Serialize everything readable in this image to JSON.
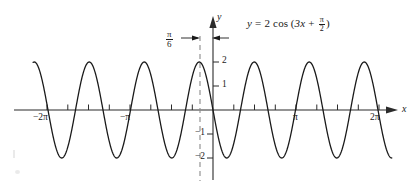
{
  "figure": {
    "title_equation": {
      "lhs": "y",
      "equals": "=",
      "amplitude": "2",
      "func": "cos",
      "open_paren": "(",
      "inner_linear": "3x",
      "plus": "+",
      "phase_num": "π",
      "phase_den": "2",
      "close_paren": ")",
      "plain": "y = 2 cos(3x + π/2)"
    },
    "axes": {
      "x_axis_label": "x",
      "y_axis_label": "y",
      "x_tick_labels": [
        {
          "text": "−2π",
          "value": -6.283185
        },
        {
          "text": "−π",
          "value": -3.141593
        },
        {
          "text": "π",
          "value": 3.141593
        },
        {
          "text": "2π",
          "value": 6.283185
        }
      ],
      "y_tick_labels": [
        {
          "text": "2",
          "value": 2
        },
        {
          "text": "1",
          "value": 1
        },
        {
          "text": "−1",
          "value": -1
        },
        {
          "text": "−2",
          "value": -2
        }
      ]
    },
    "annotation": {
      "phase_shift_num": "π",
      "phase_shift_den": "6",
      "phase_shift_plain": "π/6",
      "dashed_line_x": -0.5235988
    },
    "colors": {
      "curve": "#1a1a1a",
      "axis": "#2b2b2b",
      "dashed": "#8a8a8a",
      "background": "#ffffff"
    }
  },
  "chart_data": {
    "type": "line",
    "xlabel": "x",
    "ylabel": "y",
    "xlim": [
      -6.806784,
      6.806784
    ],
    "ylim": [
      -2.6,
      2.6
    ],
    "grid": false,
    "legend": false,
    "function": {
      "expression": "2*cos(3*x + pi/2)",
      "amplitude": 2,
      "angular_frequency": 3,
      "phase": 1.5707963,
      "period": 2.0943951,
      "phase_shift": -0.5235988
    },
    "x_ticks": [
      -6.283185,
      -5.497787,
      -4.712389,
      -3.926991,
      -3.141593,
      -2.356194,
      -1.570796,
      -0.785398,
      0.785398,
      1.570796,
      2.356194,
      3.141593,
      3.926991,
      4.712389,
      5.497787,
      6.283185
    ],
    "x_tick_labels": [
      "−2π",
      "",
      "",
      "",
      "−π",
      "",
      "",
      "",
      "",
      "",
      "",
      "π",
      "",
      "",
      "",
      "2π"
    ],
    "y_ticks": [
      -2,
      -1,
      1,
      2
    ],
    "y_tick_labels": [
      "−2",
      "−1",
      "1",
      "2"
    ],
    "annotations": [
      {
        "text": "π/6",
        "kind": "phase-shift-bracket",
        "x_from": -0.5235988,
        "x_to": 0
      },
      {
        "text": "y = 2 cos(3x + π/2)",
        "kind": "equation-label",
        "x": 2.0,
        "y": 2.4
      }
    ],
    "maxima_x": [
      -6.283185,
      -4.18879,
      -2.094395,
      -0.523599,
      1.570796,
      3.665191,
      5.759587
    ],
    "minima_x": [
      -5.235988,
      -3.141593,
      -1.047198,
      0.523599,
      2.617994,
      4.712389
    ],
    "series": [
      {
        "name": "y = 2 cos(3x + π/2)",
        "x": [
          -6.8,
          -6.6,
          -6.4,
          -6.2,
          -6.0,
          -5.8,
          -5.6,
          -5.4,
          -5.2,
          -5.0,
          -4.8,
          -4.6,
          -4.4,
          -4.2,
          -4.0,
          -3.8,
          -3.6,
          -3.4,
          -3.2,
          -3.0,
          -2.8,
          -2.6,
          -2.4,
          -2.2,
          -2.0,
          -1.8,
          -1.6,
          -1.4,
          -1.2,
          -1.0,
          -0.8,
          -0.6,
          -0.4,
          -0.2,
          0.0,
          0.2,
          0.4,
          0.6,
          0.8,
          1.0,
          1.2,
          1.4,
          1.6,
          1.8,
          2.0,
          2.2,
          2.4,
          2.6,
          2.8,
          3.0,
          3.2,
          3.4,
          3.6,
          3.8,
          4.0,
          4.2,
          4.4,
          4.6,
          4.8,
          5.0,
          5.2,
          5.4,
          5.6,
          5.8,
          6.0,
          6.2,
          6.4,
          6.6,
          6.8
        ],
        "y": [
          1.03,
          1.94,
          1.52,
          0.11,
          -1.35,
          -1.99,
          -1.17,
          0.34,
          1.65,
          1.85,
          0.71,
          -0.85,
          -1.89,
          -1.59,
          -0.23,
          1.28,
          2.0,
          1.28,
          -0.23,
          -1.59,
          -1.89,
          -0.85,
          0.71,
          1.85,
          1.65,
          0.34,
          -1.17,
          -1.99,
          -1.35,
          0.11,
          1.52,
          1.94,
          1.03,
          -0.56,
          -1.77,
          -1.75,
          -0.52,
          1.06,
          1.95,
          1.49,
          0.07,
          -1.38,
          -1.99,
          -1.14,
          0.38,
          1.67,
          1.83,
          0.67,
          -0.88,
          -1.9,
          -1.57,
          -0.19,
          1.31,
          2.0,
          1.25,
          -0.27,
          -1.61,
          -1.88,
          -0.82,
          0.75,
          1.86,
          1.63,
          0.3,
          -1.2,
          -1.99,
          -1.32,
          0.15,
          1.54,
          1.93
        ]
      }
    ]
  }
}
